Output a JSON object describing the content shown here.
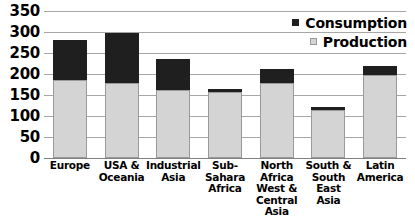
{
  "chart_data": {
    "type": "bar",
    "stacked": true,
    "title": "",
    "xlabel": "",
    "ylabel": "",
    "ylim": [
      0,
      350
    ],
    "yticks": [
      0,
      50,
      100,
      150,
      200,
      250,
      300,
      350
    ],
    "ytick_labels": [
      "0",
      "50",
      "100",
      "150",
      "200",
      "250",
      "300",
      "350"
    ],
    "grid": true,
    "legend_position": "top-right",
    "categories": [
      "Europe",
      "USA & Oceania",
      "Industrial Asia",
      "Sub-Sahara Africa",
      "North Africa West & Central Asia",
      "South & South East Asia",
      "Latin America"
    ],
    "category_lines": [
      [
        "Europe"
      ],
      [
        "USA &",
        "Oceania"
      ],
      [
        "Industrial",
        "Asia"
      ],
      [
        "Sub-Sahara",
        "Africa"
      ],
      [
        "North",
        "Africa",
        "West &",
        "Central Asia"
      ],
      [
        "South &",
        "South East",
        "Asia"
      ],
      [
        "Latin",
        "America"
      ]
    ],
    "series": [
      {
        "name": "Production",
        "color": "#d4d4d4",
        "values": [
          185,
          178,
          162,
          158,
          178,
          115,
          198
        ]
      },
      {
        "name": "Consumption",
        "color": "#1f1f1f",
        "values": [
          95,
          119,
          73,
          7,
          34,
          7,
          20
        ]
      }
    ],
    "totals": [
      280,
      297,
      235,
      165,
      212,
      122,
      218
    ],
    "legend": [
      {
        "label": "Consumption",
        "color": "#1f1f1f"
      },
      {
        "label": "Production",
        "color": "#d4d4d4"
      }
    ]
  }
}
